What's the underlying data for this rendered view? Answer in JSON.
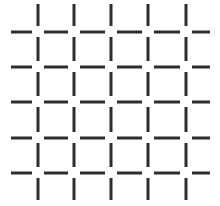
{
  "figure": {
    "type": "line-art-grid",
    "canvas": {
      "width": 220,
      "height": 206,
      "background_color": "#ffffff"
    },
    "line_style": {
      "color": "#2d2d2d",
      "thickness": 3,
      "cap": "butt"
    },
    "grid": {
      "vertical_line_count": 5,
      "horizontal_line_count": 5,
      "vertical_line_x": [
        38,
        74,
        111,
        148,
        186
      ],
      "horizontal_line_y": [
        32,
        67,
        102,
        138,
        173
      ],
      "vertical_span": [
        4,
        200
      ],
      "horizontal_span": [
        11,
        210
      ],
      "intersection_gap": 11,
      "segments_per_vertical_line": 6,
      "segments_per_horizontal_line": 6,
      "total_intersections": 25
    }
  },
  "chart_data": {
    "type": "scatter",
    "xlabel": "",
    "ylabel": "",
    "xlim": [
      0,
      220
    ],
    "ylim": [
      0,
      206
    ],
    "grid": false,
    "legend": "none",
    "annotations": [],
    "series": [
      {
        "name": "vertical-dash-segments",
        "orientation": "vertical",
        "color": "#2d2d2d",
        "width": 3,
        "x": [
          38,
          74,
          111,
          148,
          186
        ],
        "segments_y": [
          [
            4,
            26
          ],
          [
            37,
            61
          ],
          [
            72,
            96
          ],
          [
            107,
            132
          ],
          [
            143,
            167
          ],
          [
            178,
            200
          ]
        ]
      },
      {
        "name": "horizontal-dash-segments",
        "orientation": "horizontal",
        "color": "#2d2d2d",
        "width": 3,
        "y": [
          32,
          67,
          102,
          138,
          173
        ],
        "segments_x": [
          [
            11,
            32
          ],
          [
            44,
            68
          ],
          [
            80,
            105
          ],
          [
            117,
            142
          ],
          [
            154,
            180
          ],
          [
            192,
            210
          ]
        ]
      }
    ]
  }
}
